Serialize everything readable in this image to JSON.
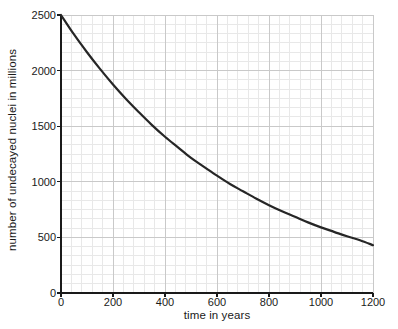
{
  "chart_data": {
    "type": "line",
    "title": "",
    "subtitle": "",
    "xlabel": "time in years",
    "ylabel": "number of undecayed nuclei in millions",
    "xlim": [
      0,
      1200
    ],
    "ylim": [
      0,
      2500
    ],
    "xticks": [
      0,
      200,
      400,
      600,
      800,
      1000,
      1200
    ],
    "xtick_labels": [
      "0",
      "200",
      "400",
      "600",
      "800",
      "1000",
      "1200"
    ],
    "yticks": [
      0,
      500,
      1000,
      1500,
      2000,
      2500
    ],
    "ytick_labels": [
      "0",
      "500",
      "1000",
      "1500",
      "2000",
      "2500"
    ],
    "grid": true,
    "grid_major_color": "#c9c9c9",
    "grid_minor_color": "#e8e8e8",
    "minor_ticks_per_major_x": 4,
    "minor_ticks_per_major_y": 5,
    "axis_color": "#1a1a1a",
    "legend": null,
    "legend_position": "none",
    "series": [
      {
        "name": "undecayed nuclei",
        "color": "#262626",
        "line_width": 2.2,
        "model": "exponential decay",
        "initial_value": 2500,
        "half_life_years": 470,
        "x": [
          0,
          50,
          100,
          150,
          200,
          250,
          300,
          350,
          400,
          450,
          500,
          550,
          600,
          650,
          700,
          750,
          800,
          850,
          900,
          950,
          1000,
          1050,
          1100,
          1150,
          1200
        ],
        "values": [
          2500,
          2325,
          2165,
          2015,
          1875,
          1745,
          1625,
          1510,
          1405,
          1310,
          1215,
          1135,
          1055,
          980,
          915,
          850,
          790,
          735,
          685,
          635,
          590,
          550,
          510,
          475,
          430
        ]
      }
    ],
    "annotations": []
  }
}
